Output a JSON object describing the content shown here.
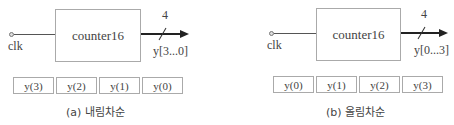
{
  "panels": [
    {
      "input_label": "clk",
      "block_label": "counter16",
      "bus_width": "4",
      "output_label": "y[3...0]",
      "cells": [
        "y(3)",
        "y(2)",
        "y(1)",
        "y(0)"
      ],
      "caption": "(a) 내림차순"
    },
    {
      "input_label": "clk",
      "block_label": "counter16",
      "bus_width": "4",
      "output_label": "y[0...3]",
      "cells": [
        "y(0)",
        "y(1)",
        "y(2)",
        "y(3)"
      ],
      "caption": "(b) 올림차순"
    }
  ]
}
